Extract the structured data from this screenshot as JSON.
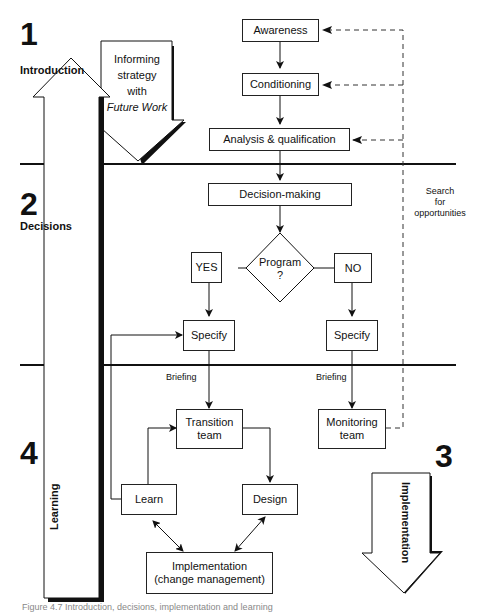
{
  "sections": [
    {
      "number": "1",
      "label": "Introduction"
    },
    {
      "number": "2",
      "label": "Decisions"
    },
    {
      "number": "3",
      "label": "Implementation"
    },
    {
      "number": "4",
      "label": "Learning"
    }
  ],
  "intro_arrow": {
    "line1": "Informing",
    "line2": "strategy",
    "line3": "with",
    "line4": "Future Work"
  },
  "nodes": {
    "awareness": "Awareness",
    "conditioning": "Conditioning",
    "analysis": "Analysis & qualification",
    "decision": "Decision-making",
    "program_line1": "Program",
    "program_line2": "?",
    "yes": "YES",
    "no": "NO",
    "specify_yes": "Specify",
    "specify_no": "Specify",
    "transition_line1": "Transition",
    "transition_line2": "team",
    "monitoring_line1": "Monitoring",
    "monitoring_line2": "team",
    "learn": "Learn",
    "design": "Design",
    "implementation_line1": "Implementation",
    "implementation_line2": "(change management)"
  },
  "labels": {
    "briefing_left": "Briefing",
    "briefing_right": "Briefing",
    "search_line1": "Search",
    "search_line2": "for",
    "search_line3": "opportunities"
  },
  "caption": "Figure 4.7  Introduction, decisions, implementation and learning"
}
